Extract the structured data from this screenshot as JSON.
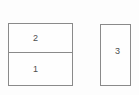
{
  "diagram": {
    "background_color": "#fdfdfd",
    "block_fill_color": "#fefefe",
    "border_color": "#8a8a8a",
    "label_color": "#4d4d4d",
    "left_block": {
      "cells": [
        {
          "label": "2"
        },
        {
          "label": "1"
        }
      ]
    },
    "right_block": {
      "label": "3"
    }
  }
}
